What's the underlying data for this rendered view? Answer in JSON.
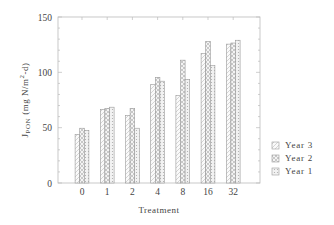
{
  "chart_data": {
    "type": "bar",
    "title": "",
    "xlabel": "Treatment",
    "ylabel": "J_PON (mg N/m^2-d)",
    "ylabel_parts": {
      "main": "J",
      "sub": "PON",
      "units_pre": "(mg N/m",
      "sup": "2",
      "units_post": "-d)"
    },
    "ylim": [
      0,
      150
    ],
    "yticks": [
      0,
      50,
      100,
      150
    ],
    "categories": [
      "0",
      "1",
      "2",
      "4",
      "8",
      "16",
      "32"
    ],
    "series": [
      {
        "name": "Year 3",
        "pattern": "light-diagonal",
        "values": [
          44,
          66.5,
          61,
          89,
          79,
          117,
          125.5
        ]
      },
      {
        "name": "Year 2",
        "pattern": "cross-hatch",
        "values": [
          49.5,
          67.5,
          67.5,
          95.5,
          111,
          128,
          126.5
        ]
      },
      {
        "name": "Year 1",
        "pattern": "dotted",
        "values": [
          47.5,
          68.5,
          49.5,
          92,
          93.5,
          106,
          129
        ]
      }
    ],
    "legend": {
      "position": "right-bottom",
      "entries": [
        "Year 3",
        "Year 2",
        "Year 1"
      ]
    },
    "grid": false
  }
}
